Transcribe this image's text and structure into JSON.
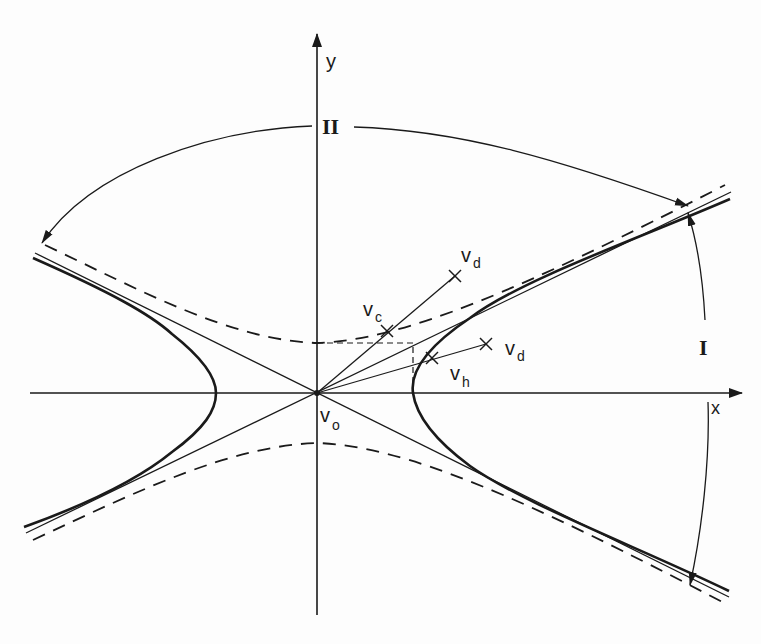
{
  "figure": {
    "type": "hyperbola-velocity-diagram",
    "colors": {
      "ink": "#1a1a1a",
      "background": "#fdfdfd"
    },
    "axes": {
      "x_label": "x",
      "y_label": "y",
      "origin_label": "v",
      "origin_subscript": "o"
    },
    "points": [
      {
        "id": "vc",
        "label": "v",
        "subscript": "c"
      },
      {
        "id": "vd_upper",
        "label": "v",
        "subscript": "d"
      },
      {
        "id": "vh",
        "label": "v",
        "subscript": "h"
      },
      {
        "id": "vd_lower",
        "label": "v",
        "subscript": "d"
      }
    ],
    "regions": [
      {
        "id": "I",
        "label": "I"
      },
      {
        "id": "II",
        "label": "II"
      }
    ],
    "curves": {
      "hyperbola": "solid-thick",
      "asymptotes": "solid-thin",
      "conjugate_hyperbola": "dashed",
      "construction_rectangle": "dashed-thin"
    }
  }
}
